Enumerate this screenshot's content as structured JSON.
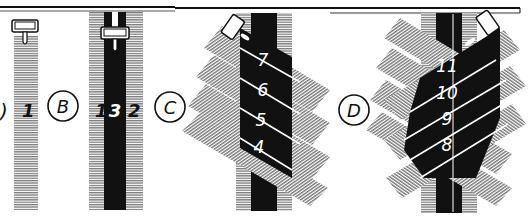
{
  "figure": {
    "panels": [
      {
        "id": "A",
        "label": "A",
        "stroke_numbers": [
          "1"
        ]
      },
      {
        "id": "B",
        "label": "B",
        "stroke_numbers": [
          "1",
          "3",
          "2"
        ]
      },
      {
        "id": "C",
        "label": "C",
        "stroke_numbers": [
          "7",
          "6",
          "5",
          "4"
        ]
      },
      {
        "id": "D",
        "label": "D",
        "stroke_numbers": [
          "11",
          "10",
          "9",
          "8"
        ]
      }
    ],
    "colors": {
      "ink": "#111111",
      "hatch": "#8a8a8a",
      "paper": "#ffffff"
    }
  }
}
